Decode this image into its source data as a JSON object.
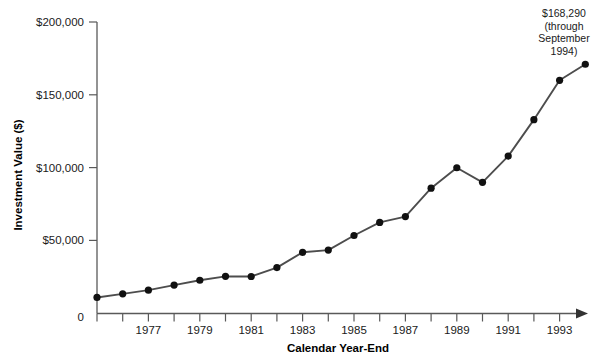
{
  "chart_data": {
    "type": "line",
    "title": "",
    "subtitle": "",
    "xlabel": "Calendar Year-End",
    "ylabel": "Investment Value ($)",
    "grid": false,
    "legend": "none",
    "xlim": [
      1975,
      1994.75
    ],
    "ylim": [
      0,
      200000
    ],
    "y_ticks": [
      0,
      50000,
      100000,
      150000,
      200000
    ],
    "y_tick_labels": [
      "0",
      "$50,000",
      "$100,000",
      "$150,000",
      "$200,000"
    ],
    "x_ticks": [
      1975,
      1976,
      1977,
      1978,
      1979,
      1980,
      1981,
      1982,
      1983,
      1984,
      1985,
      1986,
      1987,
      1988,
      1989,
      1990,
      1991,
      1992,
      1993,
      1994
    ],
    "x_tick_labels": [
      "",
      "",
      "1977",
      "",
      "1979",
      "",
      "1981",
      "",
      "1983",
      "",
      "1985",
      "",
      "1987",
      "",
      "1989",
      "",
      "1991",
      "",
      "1993",
      ""
    ],
    "x": [
      1975,
      1976,
      1977,
      1978,
      1979,
      1980,
      1981,
      1982,
      1983,
      1984,
      1985,
      1986,
      1987,
      1988,
      1989,
      1990,
      1991,
      1992,
      1993,
      1994
    ],
    "values": [
      11000,
      13500,
      16000,
      19500,
      22800,
      25500,
      25400,
      31500,
      42000,
      43500,
      53500,
      62500,
      66500,
      86000,
      100000,
      90000,
      108000,
      133000,
      160000,
      171000
    ],
    "annotations": [
      {
        "text_lines": [
          "$168,290",
          "(through",
          "September",
          "1994)"
        ],
        "value": 168290,
        "x": 1994,
        "note": "final data point label"
      }
    ]
  },
  "axes": {
    "y_title": "Investment Value ($)",
    "x_title": "Calendar Year-End",
    "y_labels": {
      "t200": "$200,000",
      "t150": "$150,000",
      "t100": "$100,000",
      "t50": "$50,000",
      "t0": "0"
    },
    "x_labels": {
      "y1977": "1977",
      "y1979": "1979",
      "y1981": "1981",
      "y1983": "1983",
      "y1985": "1985",
      "y1987": "1987",
      "y1989": "1989",
      "y1991": "1991",
      "y1993": "1993"
    }
  },
  "annotation": {
    "line1": "$168,290",
    "line2": "(through",
    "line3": "September",
    "line4": "1994)"
  },
  "colors": {
    "line": "#4d4d4d",
    "marker": "#111111",
    "axis": "#595959",
    "text": "#1a1a1a",
    "background": "#ffffff"
  }
}
